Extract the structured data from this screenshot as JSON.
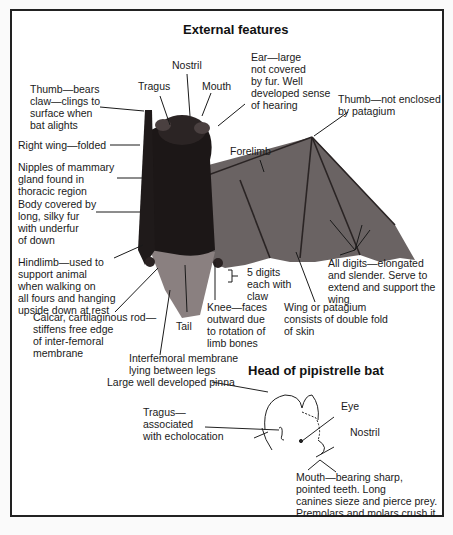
{
  "diagram": {
    "title": "External features",
    "subtitle": "Head of pipistrelle bat",
    "labels": {
      "nostril": "Nostril",
      "tragus": "Tragus",
      "mouth": "Mouth",
      "ear": "Ear—large\nnot covered\nby fur. Well\ndeveloped sense\nof hearing",
      "thumb_claw": "Thumb—bears\nclaw—clings to\nsurface when\nbat alights",
      "thumb_not_enclosed": "Thumb—not enclosed\nby patagium",
      "right_wing": "Right wing—folded",
      "forelimb": "Forelimb",
      "nipples": "Nipples of mammary\ngland found in\nthoracic region",
      "body_fur": "Body covered by\nlong, silky fur\nwith underfur\nof down",
      "hindlimb": "Hindlimb—used to\nsupport animal\nwhen walking on\nall fours and hanging\nupside down at rest",
      "five_digits": "5 digits\neach with\nclaw",
      "all_digits": "All digits—elongated\nand slender. Serve to\nextend and support the\nwing",
      "calcar": "Calcar, cartilaginous rod—\nstiffens free edge\nof inter-femoral\nmembrane",
      "tail": "Tail",
      "knee": "Knee—faces\noutward due\nto rotation of\nlimb bones",
      "wing_patagium": "Wing or patagium\nconsists of double fold\nof skin",
      "interfemoral": "Interfemoral membrane\nlying between legs"
    },
    "head_labels": {
      "pinna": "Large well developed pinna",
      "tragus": "Tragus—\nassociated\nwith echolocation",
      "eye": "Eye",
      "nostril": "Nostril",
      "mouth": "Mouth—bearing sharp,\npointed teeth. Long\ncanines sieze and pierce prey.\nPremolars and molars crush it"
    }
  }
}
